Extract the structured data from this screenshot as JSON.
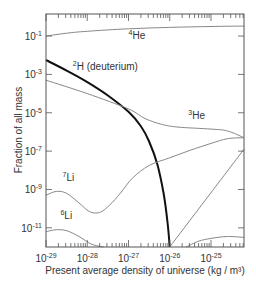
{
  "chart_data": {
    "type": "line",
    "title": "",
    "xlabel": "Present average density of universe (kg / m³)",
    "ylabel": "Fraction of all mass",
    "xscale": "log",
    "yscale": "log",
    "xlim_log10": [
      -29,
      -24.2
    ],
    "ylim_log10": [
      -12.0,
      0.15
    ],
    "x_tick_labels": [
      {
        "base": "10",
        "exp": "-29",
        "log": -29
      },
      {
        "base": "10",
        "exp": "-28",
        "log": -28
      },
      {
        "base": "10",
        "exp": "-27",
        "log": -27
      },
      {
        "base": "10",
        "exp": "-26",
        "log": -26
      },
      {
        "base": "10",
        "exp": "-25",
        "log": -25
      }
    ],
    "y_tick_labels": [
      {
        "base": "10",
        "exp": "-1",
        "log": -1
      },
      {
        "base": "10",
        "exp": "-3",
        "log": -3
      },
      {
        "base": "10",
        "exp": "-5",
        "log": -5
      },
      {
        "base": "10",
        "exp": "-7",
        "log": -7
      },
      {
        "base": "10",
        "exp": "-9",
        "log": -9
      },
      {
        "base": "10",
        "exp": "-11",
        "log": -11
      }
    ],
    "grid": false,
    "legend": "inline labels",
    "series": [
      {
        "name": "⁴He",
        "label_sup": "4",
        "label_base": "He",
        "color": "#888888",
        "width": 1,
        "points_log10": [
          [
            -29,
            -1.0
          ],
          [
            -28.5,
            -0.85
          ],
          [
            -28,
            -0.75
          ],
          [
            -27,
            -0.62
          ],
          [
            -26,
            -0.55
          ],
          [
            -25,
            -0.5
          ],
          [
            -24.2,
            -0.48
          ]
        ],
        "label_at": [
          -27.0,
          -1.15
        ]
      },
      {
        "name": "²H (deuterium)",
        "label_sup": "2",
        "label_base": "H (deuterium)",
        "color": "#111111",
        "width": 2,
        "points_log10": [
          [
            -29,
            -2.25
          ],
          [
            -28.5,
            -2.8
          ],
          [
            -28,
            -3.4
          ],
          [
            -27.5,
            -4.1
          ],
          [
            -27,
            -4.95
          ],
          [
            -26.7,
            -5.7
          ],
          [
            -26.5,
            -6.5
          ],
          [
            -26.3,
            -7.7
          ],
          [
            -26.15,
            -9.2
          ],
          [
            -26.05,
            -10.8
          ],
          [
            -26,
            -12.0
          ]
        ],
        "label_at": [
          -28.35,
          -2.75
        ]
      },
      {
        "name": "³He",
        "label_sup": "3",
        "label_base": "He",
        "color": "#888888",
        "width": 1,
        "points_log10": [
          [
            -29,
            -3.3
          ],
          [
            -28,
            -4.0
          ],
          [
            -27,
            -4.8
          ],
          [
            -26.6,
            -5.3
          ],
          [
            -26.2,
            -5.6
          ],
          [
            -25.8,
            -5.75
          ],
          [
            -25,
            -5.85
          ],
          [
            -24.6,
            -5.95
          ],
          [
            -24.2,
            -6.3
          ]
        ],
        "label_at": [
          -25.55,
          -5.3
        ]
      },
      {
        "name": "⁷Li",
        "label_sup": "7",
        "label_base": "Li",
        "color": "#888888",
        "width": 1,
        "points_log10": [
          [
            -29,
            -9.3
          ],
          [
            -28.75,
            -9.1
          ],
          [
            -28.5,
            -9.2
          ],
          [
            -28.2,
            -9.7
          ],
          [
            -27.95,
            -10.15
          ],
          [
            -27.7,
            -10.2
          ],
          [
            -27.45,
            -9.8
          ],
          [
            -27.2,
            -9.2
          ],
          [
            -26.9,
            -8.4
          ],
          [
            -26.5,
            -7.75
          ],
          [
            -26,
            -7.35
          ],
          [
            -25.5,
            -6.95
          ],
          [
            -25,
            -6.6
          ],
          [
            -24.6,
            -6.35
          ],
          [
            -24.2,
            -6.3
          ]
        ],
        "label_at": [
          -28.6,
          -8.55
        ]
      },
      {
        "name": "⁶Li",
        "label_sup": "6",
        "label_base": "Li",
        "color": "#888888",
        "width": 1,
        "points_log10": [
          [
            -29,
            -11.2
          ],
          [
            -28.75,
            -11.1
          ],
          [
            -28.5,
            -11.15
          ],
          [
            -28.2,
            -11.45
          ],
          [
            -27.9,
            -11.85
          ],
          [
            -27.6,
            -12.0
          ]
        ],
        "label_at": [
          -28.65,
          -10.55
        ]
      },
      {
        "name": "unlabeled rising",
        "label_sup": "",
        "label_base": "",
        "color": "#888888",
        "width": 1,
        "points_log10": [
          [
            -26,
            -12.0
          ],
          [
            -24.2,
            -6.9
          ]
        ]
      },
      {
        "name": "unlabeled arc",
        "label_sup": "",
        "label_base": "",
        "color": "#888888",
        "width": 1,
        "points_log10": [
          [
            -25.6,
            -12.0
          ],
          [
            -25.3,
            -11.7
          ],
          [
            -25,
            -11.55
          ],
          [
            -24.6,
            -11.45
          ],
          [
            -24.2,
            -11.5
          ]
        ]
      }
    ]
  }
}
